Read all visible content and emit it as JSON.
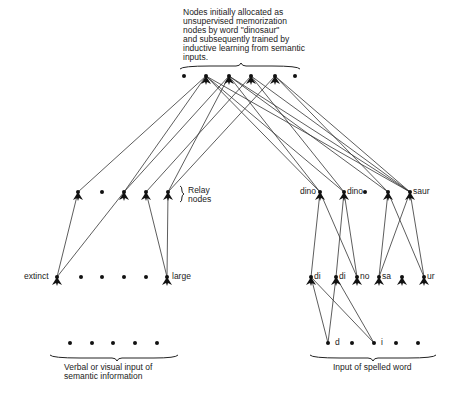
{
  "top_caption": {
    "lines": [
      "Nodes initially allocated as",
      "unsupervised memorization",
      "nodes by word \"dinosaur\"",
      "and subsequently trained by",
      "inductive learning from semantic",
      "inputs."
    ]
  },
  "relay_label": [
    "Relay",
    "nodes"
  ],
  "left_row2_labels": {
    "left": "extinct",
    "right": "large"
  },
  "right_row1_labels": [
    "dino",
    "dino",
    "saur"
  ],
  "right_row2_labels": [
    "di",
    "di",
    "no",
    "sa",
    "ur"
  ],
  "right_input_labels": [
    "d",
    "i"
  ],
  "bottom_left_caption": [
    "Verbal or visual input of",
    "semantic information"
  ],
  "bottom_right_caption": "Input of spelled word",
  "nodes": {
    "top": [
      [
        184,
        76,
        "dot"
      ],
      [
        206,
        76,
        "node"
      ],
      [
        229,
        76,
        "node"
      ],
      [
        251,
        76,
        "node"
      ],
      [
        275,
        76,
        "node"
      ],
      [
        295,
        76,
        "dot"
      ]
    ],
    "left_relay": [
      [
        78,
        192,
        "node"
      ],
      [
        102,
        192,
        "dot"
      ],
      [
        124,
        192,
        "node"
      ],
      [
        146,
        192,
        "node"
      ],
      [
        168,
        192,
        "node"
      ]
    ],
    "left_row2": [
      [
        57,
        277,
        "node"
      ],
      [
        81,
        277,
        "dot"
      ],
      [
        102,
        277,
        "dot"
      ],
      [
        124,
        277,
        "dot"
      ],
      [
        146,
        277,
        "dot"
      ],
      [
        167,
        277,
        "node"
      ]
    ],
    "left_input": [
      [
        70,
        343
      ],
      [
        92,
        343
      ],
      [
        113,
        343
      ],
      [
        135,
        343
      ],
      [
        157,
        343
      ]
    ],
    "right_row1": [
      [
        320,
        192,
        "node"
      ],
      [
        344,
        192,
        "node"
      ],
      [
        365,
        192,
        "dot"
      ],
      [
        388,
        192,
        "node"
      ],
      [
        410,
        192,
        "node"
      ]
    ],
    "right_row2": [
      [
        311,
        277,
        "node"
      ],
      [
        336,
        277,
        "node"
      ],
      [
        357,
        277,
        "node"
      ],
      [
        379,
        277,
        "node"
      ],
      [
        402,
        277,
        "node"
      ],
      [
        424,
        277,
        "node"
      ]
    ],
    "right_input": [
      [
        328,
        343
      ],
      [
        352,
        343
      ],
      [
        374,
        343
      ],
      [
        396,
        343
      ],
      [
        418,
        343
      ]
    ]
  },
  "edges": [
    [
      78,
      192,
      206,
      76
    ],
    [
      124,
      192,
      206,
      76
    ],
    [
      124,
      192,
      229,
      76
    ],
    [
      146,
      192,
      251,
      76
    ],
    [
      168,
      192,
      275,
      76
    ],
    [
      168,
      192,
      229,
      76
    ],
    [
      320,
      192,
      206,
      76
    ],
    [
      320,
      192,
      229,
      76
    ],
    [
      344,
      192,
      206,
      76
    ],
    [
      344,
      192,
      251,
      76
    ],
    [
      388,
      192,
      229,
      76
    ],
    [
      388,
      192,
      275,
      76
    ],
    [
      410,
      192,
      206,
      76
    ],
    [
      410,
      192,
      251,
      76
    ],
    [
      410,
      192,
      275,
      76
    ],
    [
      410,
      192,
      229,
      76
    ],
    [
      57,
      277,
      78,
      192
    ],
    [
      57,
      277,
      124,
      192
    ],
    [
      167,
      277,
      146,
      192
    ],
    [
      167,
      277,
      168,
      192
    ],
    [
      311,
      277,
      320,
      192
    ],
    [
      357,
      277,
      320,
      192
    ],
    [
      336,
      277,
      344,
      192
    ],
    [
      357,
      277,
      344,
      192
    ],
    [
      379,
      277,
      388,
      192
    ],
    [
      424,
      277,
      388,
      192
    ],
    [
      379,
      277,
      410,
      192
    ],
    [
      424,
      277,
      410,
      192
    ],
    [
      328,
      343,
      311,
      277
    ],
    [
      328,
      343,
      336,
      277
    ],
    [
      374,
      343,
      311,
      277
    ],
    [
      374,
      343,
      336,
      277
    ]
  ]
}
